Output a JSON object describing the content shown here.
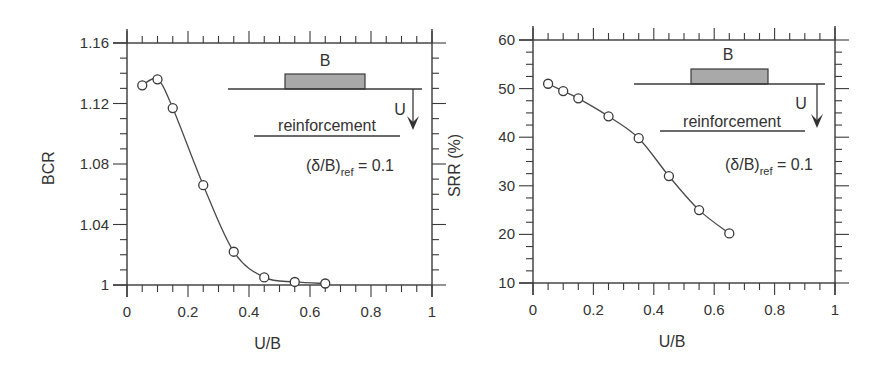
{
  "chart_data": [
    {
      "type": "line",
      "id": "bcr",
      "title": "",
      "xlabel": "U/B",
      "ylabel": "BCR",
      "xlim": [
        0,
        1
      ],
      "ylim": [
        1,
        1.16
      ],
      "xticks": [
        0,
        0.2,
        0.4,
        0.6,
        0.8,
        1
      ],
      "xtick_labels": [
        "0",
        "0.2",
        "0.4",
        "0.6",
        "0.8",
        "1"
      ],
      "yticks": [
        1,
        1.04,
        1.08,
        1.12,
        1.16
      ],
      "ytick_labels": [
        "1",
        "1.04",
        "1.08",
        "1.12",
        "1.16"
      ],
      "x_minor_step": 0.05,
      "y_minor_step": 0.01,
      "grid": false,
      "series": [
        {
          "name": "BCR",
          "marker": "open-circle",
          "x": [
            0.05,
            0.1,
            0.15,
            0.25,
            0.35,
            0.45,
            0.55,
            0.65
          ],
          "y": [
            1.132,
            1.136,
            1.117,
            1.066,
            1.022,
            1.005,
            1.002,
            1.001
          ]
        }
      ],
      "inset": {
        "footing_label": "B",
        "depth_label": "U",
        "layer_label": "reinforcement",
        "param_main": "(δ/B)",
        "param_sub": "ref",
        "param_value": " = 0.1"
      }
    },
    {
      "type": "line",
      "id": "srr",
      "title": "",
      "xlabel": "U/B",
      "ylabel": "SRR (%)",
      "xlim": [
        0,
        1
      ],
      "ylim": [
        10,
        60
      ],
      "xticks": [
        0,
        0.2,
        0.4,
        0.6,
        0.8,
        1
      ],
      "xtick_labels": [
        "0",
        "0.2",
        "0.4",
        "0.6",
        "0.8",
        "1"
      ],
      "yticks": [
        10,
        20,
        30,
        40,
        50,
        60
      ],
      "ytick_labels": [
        "10",
        "20",
        "30",
        "40",
        "50",
        "60"
      ],
      "x_minor_step": 0.05,
      "y_minor_step": 2.5,
      "grid": false,
      "series": [
        {
          "name": "SRR",
          "marker": "open-circle",
          "x": [
            0.05,
            0.1,
            0.15,
            0.25,
            0.35,
            0.45,
            0.55,
            0.65
          ],
          "y": [
            51,
            49.5,
            48,
            44.3,
            39.8,
            32,
            25,
            20.2
          ]
        }
      ],
      "inset": {
        "footing_label": "B",
        "depth_label": "U",
        "layer_label": "reinforcement",
        "param_main": "(δ/B)",
        "param_sub": "ref",
        "param_value": " = 0.1"
      }
    }
  ]
}
